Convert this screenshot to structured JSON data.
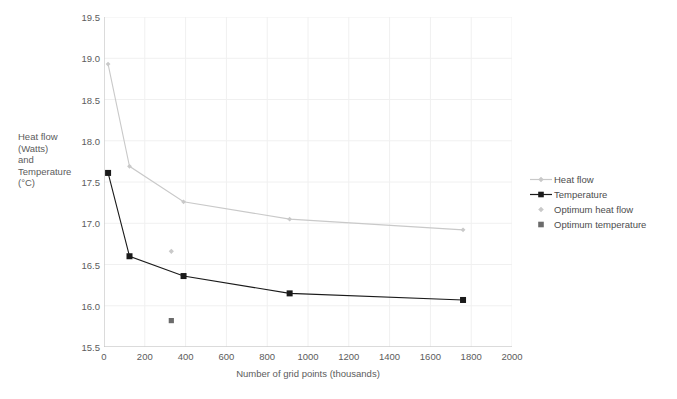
{
  "chart_data": {
    "type": "line",
    "title": "",
    "xlabel": "Number of grid points (thousands)",
    "ylabel": "Heat flow\n(Watts)\nand\nTemperature\n(°C)",
    "xlim": [
      0,
      2000
    ],
    "ylim": [
      15.5,
      19.5
    ],
    "xticks": [
      0,
      200,
      400,
      600,
      800,
      1000,
      1200,
      1400,
      1600,
      1800,
      2000
    ],
    "yticks": [
      15.5,
      16.0,
      16.5,
      17.0,
      17.5,
      18.0,
      18.5,
      19.0,
      19.5
    ],
    "grid": true,
    "legend_position": "right",
    "series": [
      {
        "name": "Heat flow",
        "type": "line",
        "color": "#c9c9c9",
        "marker": "diamond",
        "x": [
          20,
          125,
          390,
          910,
          1760
        ],
        "y": [
          18.93,
          17.69,
          17.26,
          17.05,
          16.92
        ]
      },
      {
        "name": "Temperature",
        "type": "line",
        "color": "#1a1a1a",
        "marker": "square",
        "x": [
          20,
          125,
          390,
          910,
          1760
        ],
        "y": [
          17.61,
          16.6,
          16.36,
          16.15,
          16.07
        ]
      },
      {
        "name": "Optimum heat flow",
        "type": "scatter",
        "color": "#c9c9c9",
        "marker": "diamond",
        "x": [
          330
        ],
        "y": [
          16.66
        ]
      },
      {
        "name": "Optimum temperature",
        "type": "scatter",
        "color": "#6b6b6b",
        "marker": "square",
        "x": [
          330
        ],
        "y": [
          15.82
        ]
      }
    ]
  },
  "legend": {
    "items": [
      {
        "label": "Heat flow"
      },
      {
        "label": "Temperature"
      },
      {
        "label": "Optimum heat flow"
      },
      {
        "label": "Optimum temperature"
      }
    ]
  },
  "axes": {
    "y_title": "Heat flow\n(Watts)\nand\nTemperature\n(°C)",
    "x_title": "Number of grid points (thousands)",
    "y_tick_labels": [
      "19.5",
      "19.0",
      "18.5",
      "18.0",
      "17.5",
      "17.0",
      "16.5",
      "16.0",
      "15.5"
    ],
    "x_tick_labels": [
      "0",
      "200",
      "400",
      "600",
      "800",
      "1000",
      "1200",
      "1400",
      "1600",
      "1800",
      "2000"
    ]
  },
  "colors": {
    "heat_flow": "#c9c9c9",
    "temperature": "#1a1a1a",
    "optimum_heat_flow": "#c9c9c9",
    "optimum_temperature": "#6b6b6b",
    "grid": "#f0f0f0",
    "axis": "#bfbfbf",
    "text": "#5c5c5c",
    "background": "#ffffff"
  }
}
